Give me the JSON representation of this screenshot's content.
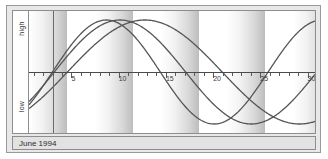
{
  "window": {
    "title": "Biorhythm Chart"
  },
  "caption": {
    "text": "June 1994"
  },
  "axis": {
    "y_high_label": "high",
    "y_low_label": "low",
    "x_tick_labels": [
      "5",
      "10",
      "15",
      "20",
      "25",
      "30"
    ]
  },
  "colors": {
    "curve": "#555555",
    "axis": "#4a4a4a",
    "today_line": "#6b6b6b",
    "band_light": "#ffffff",
    "band_dark": "#bdbdbd",
    "frame": "#8d8d8d",
    "window_bg": "#e8e8e8",
    "caption_bg": "#e2e2e2"
  },
  "chart_data": {
    "type": "line",
    "title": "June 1994",
    "xlabel": "",
    "ylabel": "",
    "xlim": [
      0.5,
      31
    ],
    "ylim": [
      -1,
      1
    ],
    "grid": false,
    "legend": "none",
    "x_ticks": [
      5,
      10,
      15,
      20,
      25,
      30
    ],
    "y_tick_labels": [
      "high",
      "low"
    ],
    "annotations": [
      {
        "name": "today-line",
        "x": 3
      },
      {
        "name": "week-bands",
        "period_days": 7
      }
    ],
    "series": [
      {
        "name": "physical",
        "type": "sine",
        "period_days": 23,
        "zero_crossing_day": 3.0,
        "amplitude": 1.0,
        "peak_day": 8.75,
        "trough_day": 20.25
      },
      {
        "name": "emotional",
        "type": "sine",
        "period_days": 28,
        "zero_crossing_day": 3.2,
        "amplitude": 1.0,
        "peak_day": 10.2,
        "trough_day": 24.2
      },
      {
        "name": "intellectual",
        "type": "sine",
        "period_days": 33,
        "zero_crossing_day": 4.6,
        "amplitude": 1.0,
        "peak_day": 12.85,
        "trough_day": 29.35
      }
    ]
  }
}
